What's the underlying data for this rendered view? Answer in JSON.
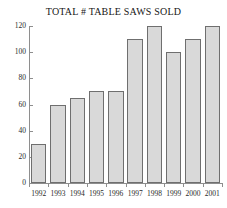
{
  "chart_data": {
    "type": "bar",
    "title": "TOTAL # TABLE SAWS SOLD",
    "xlabel": "",
    "ylabel": "",
    "categories": [
      "1992",
      "1993",
      "1994",
      "1995",
      "1996",
      "1997",
      "1998",
      "1999",
      "2000",
      "2001"
    ],
    "values": [
      30,
      60,
      65,
      70,
      70,
      110,
      120,
      100,
      110,
      120
    ],
    "ylim": [
      0,
      120
    ],
    "ytick_values": [
      0,
      20,
      40,
      60,
      80,
      100,
      120
    ],
    "ytick_labels": [
      "0",
      "20",
      "40",
      "60",
      "80",
      "100",
      "120"
    ],
    "grid": false,
    "legend": false,
    "bar_fill_color": "#d9d9d9",
    "bar_border_color": "#6f6f6f",
    "axis_color": "#8e8e8e",
    "text_color": "#2a2a2a"
  }
}
